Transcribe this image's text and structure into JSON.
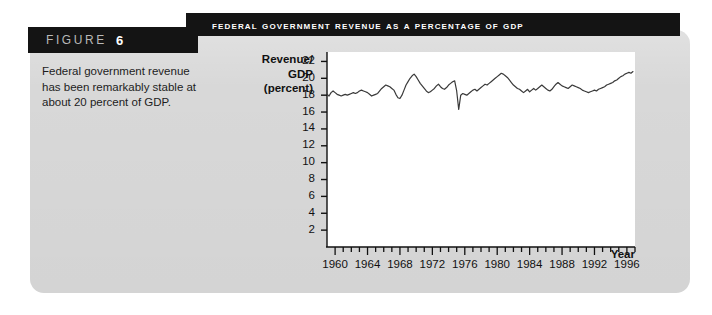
{
  "figure": {
    "banner_word": "FIGURE",
    "banner_number": "6",
    "title": "Federal Government Revenue as a Percentage of GDP",
    "caption": "Federal government revenue has been remarkably stable at about 20 percent of GDP."
  },
  "colors": {
    "banner_background": "#141414",
    "banner_word_color": "#b9b9b9",
    "banner_number_color": "#ffffff",
    "card_background": "#d8d8d8",
    "page_background": "#ffffff",
    "plot_background": "#ffffff",
    "line_color": "#3a3a3a",
    "axis_color": "#111111"
  },
  "chart_data": {
    "type": "line",
    "title": "Federal Government Revenue as a Percentage of GDP",
    "xlabel": "Year",
    "ylabel": "Revenue/ GDP (percent)",
    "ylabel_lines": [
      "Revenue/",
      "GDP",
      "(percent)"
    ],
    "xlim": [
      1959,
      1997
    ],
    "ylim": [
      0,
      23
    ],
    "ytick_values": [
      2,
      4,
      6,
      8,
      10,
      12,
      14,
      16,
      18,
      20,
      22
    ],
    "ytick_labels": [
      "2",
      "4",
      "6",
      "8",
      "10",
      "12",
      "14",
      "16",
      "18",
      "20",
      "22"
    ],
    "xtick_major_values": [
      1960,
      1964,
      1968,
      1972,
      1976,
      1980,
      1984,
      1988,
      1992,
      1996
    ],
    "xtick_major_labels": [
      "1960",
      "1964",
      "1968",
      "1972",
      "1976",
      "1980",
      "1984",
      "1988",
      "1992",
      "1996"
    ],
    "xtick_minor_step": 1,
    "grid": false,
    "legend": false,
    "series": [
      {
        "name": "Revenue/GDP (percent)",
        "x": [
          1959.0,
          1959.25,
          1959.5,
          1959.75,
          1960.0,
          1960.25,
          1960.5,
          1960.75,
          1961.0,
          1961.25,
          1961.5,
          1961.75,
          1962.0,
          1962.25,
          1962.5,
          1962.75,
          1963.0,
          1963.25,
          1963.5,
          1963.75,
          1964.0,
          1964.25,
          1964.5,
          1964.75,
          1965.0,
          1965.25,
          1965.5,
          1965.75,
          1966.0,
          1966.25,
          1966.5,
          1966.75,
          1967.0,
          1967.25,
          1967.5,
          1967.75,
          1968.0,
          1968.25,
          1968.5,
          1968.75,
          1969.0,
          1969.25,
          1969.5,
          1969.75,
          1970.0,
          1970.25,
          1970.5,
          1970.75,
          1971.0,
          1971.25,
          1971.5,
          1971.75,
          1972.0,
          1972.25,
          1972.5,
          1972.75,
          1973.0,
          1973.25,
          1973.5,
          1973.75,
          1974.0,
          1974.25,
          1974.5,
          1974.75,
          1975.0,
          1975.25,
          1975.5,
          1975.75,
          1976.0,
          1976.25,
          1976.5,
          1976.75,
          1977.0,
          1977.25,
          1977.5,
          1977.75,
          1978.0,
          1978.25,
          1978.5,
          1978.75,
          1979.0,
          1979.25,
          1979.5,
          1979.75,
          1980.0,
          1980.25,
          1980.5,
          1980.75,
          1981.0,
          1981.25,
          1981.5,
          1981.75,
          1982.0,
          1982.25,
          1982.5,
          1982.75,
          1983.0,
          1983.25,
          1983.5,
          1983.75,
          1984.0,
          1984.25,
          1984.5,
          1984.75,
          1985.0,
          1985.25,
          1985.5,
          1985.75,
          1986.0,
          1986.25,
          1986.5,
          1986.75,
          1987.0,
          1987.25,
          1987.5,
          1987.75,
          1988.0,
          1988.25,
          1988.5,
          1988.75,
          1989.0,
          1989.25,
          1989.5,
          1989.75,
          1990.0,
          1990.25,
          1990.5,
          1990.75,
          1991.0,
          1991.25,
          1991.5,
          1991.75,
          1992.0,
          1992.25,
          1992.5,
          1992.75,
          1993.0,
          1993.25,
          1993.5,
          1993.75,
          1994.0,
          1994.25,
          1994.5,
          1994.75,
          1995.0,
          1995.25,
          1995.5,
          1995.75,
          1996.0,
          1996.25,
          1996.5,
          1996.75
        ],
        "y": [
          18.1,
          17.9,
          18.3,
          18.5,
          18.3,
          18.1,
          18.0,
          17.9,
          18.0,
          18.1,
          18.0,
          18.1,
          18.2,
          18.3,
          18.2,
          18.3,
          18.5,
          18.6,
          18.5,
          18.4,
          18.3,
          18.1,
          17.9,
          18.0,
          18.1,
          18.2,
          18.5,
          18.8,
          19.0,
          19.2,
          19.1,
          19.0,
          18.8,
          18.6,
          18.1,
          17.7,
          17.6,
          18.0,
          18.6,
          19.2,
          19.6,
          20.0,
          20.3,
          20.5,
          20.2,
          19.8,
          19.4,
          19.1,
          18.8,
          18.5,
          18.3,
          18.4,
          18.6,
          18.8,
          19.1,
          19.3,
          19.0,
          18.8,
          18.7,
          18.9,
          19.2,
          19.4,
          19.6,
          19.7,
          18.5,
          16.3,
          18.0,
          18.2,
          18.1,
          18.0,
          18.2,
          18.4,
          18.6,
          18.7,
          18.5,
          18.7,
          18.9,
          19.1,
          19.3,
          19.2,
          19.4,
          19.6,
          19.8,
          20.0,
          20.2,
          20.4,
          20.6,
          20.5,
          20.3,
          20.1,
          19.8,
          19.5,
          19.2,
          19.0,
          18.8,
          18.7,
          18.5,
          18.3,
          18.5,
          18.7,
          18.4,
          18.6,
          18.8,
          18.6,
          18.8,
          19.0,
          19.2,
          19.0,
          18.8,
          18.6,
          18.5,
          18.7,
          19.0,
          19.3,
          19.5,
          19.3,
          19.1,
          19.0,
          18.9,
          18.8,
          19.0,
          19.2,
          19.1,
          19.0,
          18.9,
          18.8,
          18.6,
          18.5,
          18.4,
          18.3,
          18.4,
          18.5,
          18.6,
          18.5,
          18.7,
          18.8,
          18.9,
          19.0,
          19.2,
          19.3,
          19.4,
          19.5,
          19.7,
          19.8,
          20.0,
          20.2,
          20.3,
          20.5,
          20.6,
          20.7,
          20.6,
          20.8
        ]
      }
    ]
  }
}
